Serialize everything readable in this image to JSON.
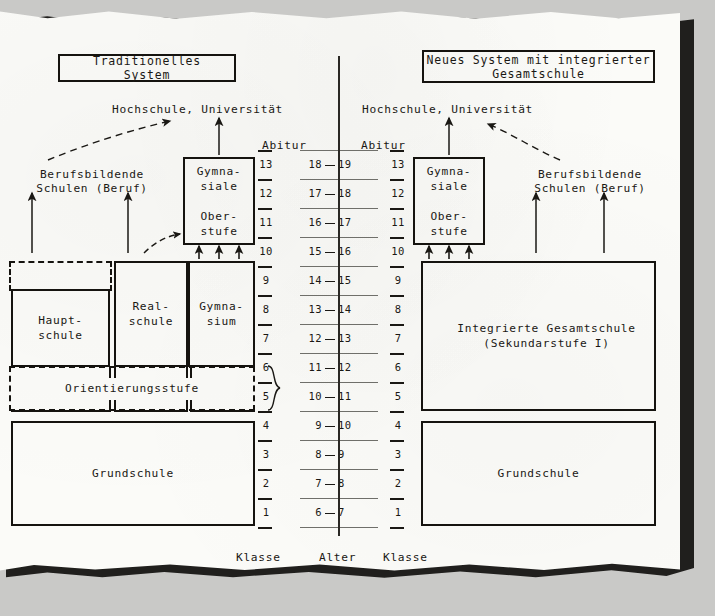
{
  "diagram": {
    "title_left": "Traditionelles System",
    "title_right": "Neues System mit integrierter\nGesamtschule",
    "goal_left": "Hochschule, Universität",
    "goal_right": "Hochschule, Universität",
    "vocational_left": "Berufsbildende\nSchulen (Beruf)",
    "vocational_right": "Berufsbildende\nSchulen (Beruf)",
    "abitur_left": "Abitur",
    "abitur_right": "Abitur",
    "axis_label_klasse_left": "Klasse",
    "axis_label_alter": "Alter",
    "axis_label_klasse_right": "Klasse"
  },
  "left_system": {
    "oberstufe": "Gymna-\nsiale\n\nOber-\nstufe",
    "hauptschule": "Haupt-\nschule",
    "realschule": "Real-\nschule",
    "gymnasium": "Gymna-\nsium",
    "orientierungsstufe": "Orientierungsstufe",
    "grundschule": "Grundschule"
  },
  "right_system": {
    "oberstufe": "Gymna-\nsiale\n\nOber-\nstufe",
    "gesamtschule": "Integrierte Gesamtschule\n(Sekundarstufe I)",
    "grundschule": "Grundschule"
  },
  "chart_data": {
    "type": "table",
    "xlabel": "",
    "ylabel": "",
    "columns": [
      "Klasse (links)",
      "Alter",
      "Klasse (rechts)"
    ],
    "rows": [
      [
        "13",
        "18 — 19",
        "13"
      ],
      [
        "12",
        "17 — 18",
        "12"
      ],
      [
        "11",
        "16 — 17",
        "11"
      ],
      [
        "10",
        "15 — 16",
        "10"
      ],
      [
        "9",
        "14 — 15",
        "9"
      ],
      [
        "8",
        "13 — 14",
        "8"
      ],
      [
        "7",
        "12 — 13",
        "7"
      ],
      [
        "6",
        "11 — 12",
        "6"
      ],
      [
        "5",
        "10 — 11",
        "5"
      ],
      [
        "4",
        "9 — 10",
        "4"
      ],
      [
        "3",
        "8 — 9",
        "3"
      ],
      [
        "2",
        "7 — 8",
        "2"
      ],
      [
        "1",
        "6 — 7",
        "1"
      ]
    ],
    "klasse_left": [
      "13",
      "12",
      "11",
      "10",
      "9",
      "8",
      "7",
      "6",
      "5",
      "4",
      "3",
      "2",
      "1"
    ],
    "klasse_right": [
      "13",
      "12",
      "11",
      "10",
      "9",
      "8",
      "7",
      "6",
      "5",
      "4",
      "3",
      "2",
      "1"
    ],
    "alter_left": [
      "18",
      "17",
      "16",
      "15",
      "14",
      "13",
      "12",
      "11",
      "10",
      "9",
      "8",
      "7",
      "6"
    ],
    "alter_right": [
      "19",
      "18",
      "17",
      "16",
      "15",
      "14",
      "13",
      "12",
      "11",
      "10",
      "9",
      "8",
      "7"
    ]
  },
  "colors": {
    "ink": "#1a1814",
    "paper": "#fbfbf8",
    "backdrop": "#c9c9c7",
    "shadow": "#201f1d",
    "rung": "#6f6f6a"
  }
}
